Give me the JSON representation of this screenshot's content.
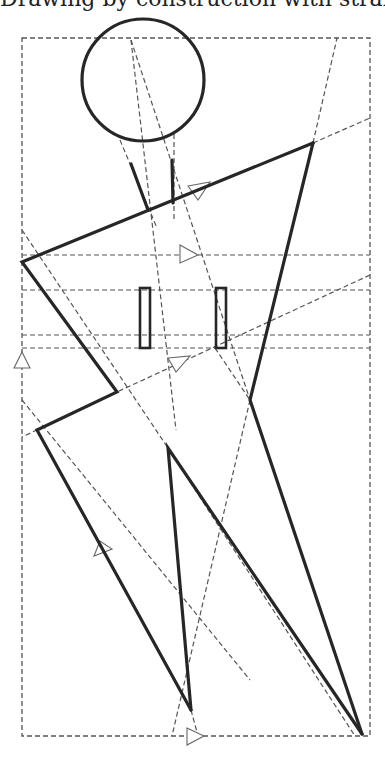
{
  "caption": {
    "text": "Drawing by construction with straight lines.",
    "visible_state": "cropped at top edge — only descenders visible"
  },
  "figure": {
    "elements": {
      "head": "circle",
      "neck": "two converging line segments",
      "torso_arms": "bold polygonal lines",
      "buttons": "two thin vertical rectangles",
      "legs": "inner V triangle"
    },
    "guides": "dashed construction lines with hollow arrowheads",
    "frame": "dashed bounding rectangle"
  },
  "colors": {
    "ink": "#262626",
    "guide": "#555555",
    "background": "#ffffff"
  }
}
